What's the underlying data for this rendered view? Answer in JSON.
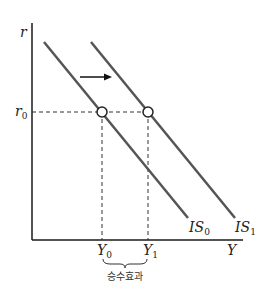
{
  "diagram": {
    "axes": {
      "y_label": "r",
      "x_label": "Y",
      "y_tick": {
        "base": "r",
        "sub": "0"
      }
    },
    "x_ticks": [
      {
        "base": "Y",
        "sub": "0"
      },
      {
        "base": "Y",
        "sub": "1"
      }
    ],
    "curves": [
      {
        "base": "IS",
        "sub": "0"
      },
      {
        "base": "IS",
        "sub": "1"
      }
    ],
    "brace_label": "승수효과",
    "colors": {
      "axis": "#1a1a1a",
      "curve": "#555555",
      "dashed": "#333333",
      "arrow": "#111111"
    }
  }
}
